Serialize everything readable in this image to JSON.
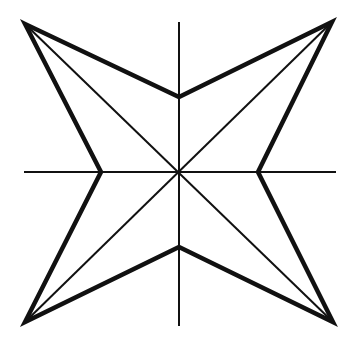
{
  "diagram": {
    "stroke_color": "#111111",
    "background": "#ffffff",
    "shape": "four-pointed star",
    "elements": [
      "outer star outline",
      "vertical axis",
      "horizontal axis",
      "diagonal 1",
      "diagonal 2"
    ]
  }
}
